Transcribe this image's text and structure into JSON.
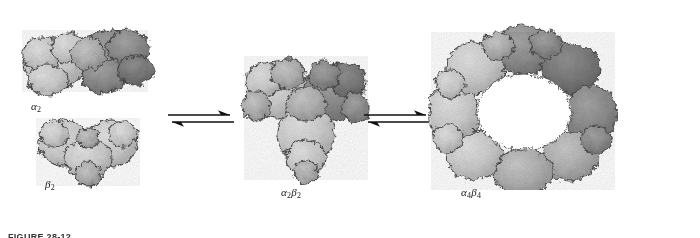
{
  "figure": {
    "caption_label": "FIGURE 28-12",
    "background_color": "#ffffff",
    "width": 700,
    "height": 238
  },
  "palette": {
    "surface_light": "#d2d2d2",
    "surface_mid": "#b4b4b4",
    "surface_dark": "#8e8e8e",
    "surface_darker": "#787878",
    "outline": "#4a4a4a",
    "arrow": "#111111",
    "label_text": "#1a1a1a"
  },
  "states": [
    {
      "id": "alpha2",
      "label": "α",
      "subscript": "2",
      "full_label": "α2",
      "description": "elongated two-lobed dimer, light lobe left, dark lobe right",
      "shape": "elongated-dimer",
      "subunit_count": 2
    },
    {
      "id": "beta2",
      "label": "β",
      "subscript": "2",
      "full_label": "β2",
      "description": "heart-shaped dimer, uniformly light gray",
      "shape": "heart-dimer",
      "subunit_count": 2
    },
    {
      "id": "alpha2beta2",
      "label_alpha": "α",
      "sub_alpha": "2",
      "label_beta": "β",
      "sub_beta": "2",
      "full_label": "α2β2",
      "description": "trefoil heart-shaped tetramer with mixed light and dark subunits",
      "shape": "trefoil-tetramer",
      "subunit_count": 4
    },
    {
      "id": "alpha4beta4",
      "label_alpha": "α",
      "sub_alpha": "4",
      "label_beta": "β",
      "sub_beta": "4",
      "full_label": "α4β4",
      "description": "ring-shaped octamer with central cavity",
      "shape": "ring-octamer",
      "subunit_count": 8
    }
  ],
  "arrows": [
    {
      "id": "equilibrium-1",
      "type": "equilibrium-double-harpoon",
      "direction": "bidirectional"
    },
    {
      "id": "equilibrium-2",
      "type": "equilibrium-double-harpoon",
      "direction": "bidirectional"
    }
  ]
}
